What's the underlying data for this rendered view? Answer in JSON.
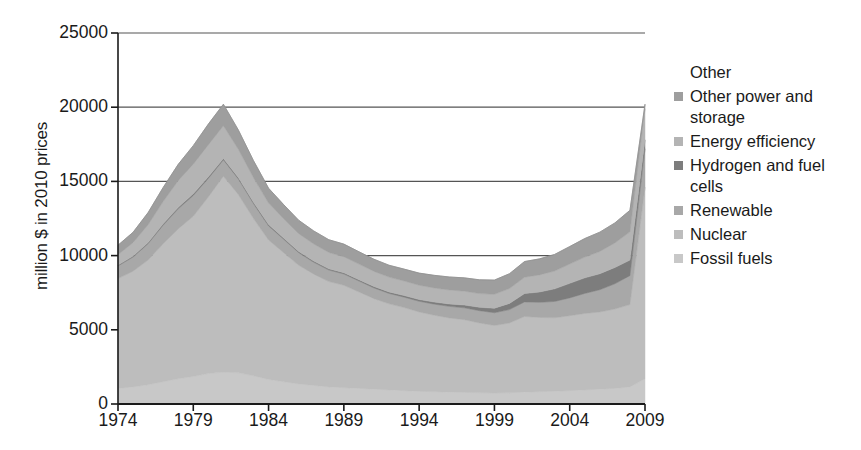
{
  "chart_data": {
    "type": "area",
    "stacked": true,
    "title": "",
    "xlabel": "",
    "ylabel": "million $ in 2010 prices",
    "xlim": [
      1974,
      2009
    ],
    "ylim": [
      0,
      25000
    ],
    "yticks": [
      0,
      5000,
      10000,
      15000,
      20000,
      25000
    ],
    "ytick_labels": [
      "0",
      "5000",
      "10000",
      "15000",
      "20000",
      "25000"
    ],
    "xticks": [
      1974,
      1979,
      1984,
      1989,
      1994,
      1999,
      2004,
      2009
    ],
    "xtick_labels": [
      "1974",
      "1979",
      "1984",
      "1989",
      "1994",
      "1999",
      "2004",
      "2009"
    ],
    "grid": "horizontal-partial",
    "legend_position": "right",
    "x": [
      1974,
      1975,
      1976,
      1977,
      1978,
      1979,
      1980,
      1981,
      1982,
      1983,
      1984,
      1985,
      1986,
      1987,
      1988,
      1989,
      1990,
      1991,
      1992,
      1993,
      1994,
      1995,
      1996,
      1997,
      1998,
      1999,
      2000,
      2001,
      2002,
      2003,
      2004,
      2005,
      2006,
      2007,
      2008,
      2009
    ],
    "series": [
      {
        "name": "Fossil fuels",
        "color": "#c8c8c8",
        "values": [
          1050,
          1150,
          1300,
          1500,
          1700,
          1850,
          2050,
          2150,
          2100,
          1900,
          1650,
          1500,
          1350,
          1250,
          1150,
          1100,
          1050,
          1000,
          950,
          900,
          850,
          830,
          800,
          780,
          760,
          740,
          760,
          800,
          830,
          860,
          900,
          950,
          1000,
          1050,
          1150,
          1700
        ]
      },
      {
        "name": "Nuclear",
        "color": "#bdbdbd",
        "values": [
          7400,
          7800,
          8400,
          9300,
          10100,
          10800,
          11900,
          13200,
          12000,
          10600,
          9400,
          8700,
          8000,
          7500,
          7100,
          6900,
          6500,
          6100,
          5800,
          5600,
          5350,
          5150,
          5000,
          4900,
          4700,
          4550,
          4700,
          5100,
          5000,
          4950,
          5050,
          5150,
          5200,
          5350,
          5550,
          12900
        ]
      },
      {
        "name": "Renewable",
        "color": "#a8a8a8",
        "values": [
          850,
          950,
          1100,
          1250,
          1350,
          1400,
          1250,
          1100,
          1050,
          1000,
          950,
          900,
          850,
          800,
          780,
          760,
          740,
          720,
          700,
          700,
          720,
          750,
          780,
          800,
          830,
          860,
          900,
          980,
          1020,
          1100,
          1200,
          1350,
          1500,
          1700,
          1950,
          2600
        ]
      },
      {
        "name": "Hydrogen and fuel cells",
        "color": "#7d7d7d",
        "values": [
          60,
          70,
          80,
          90,
          100,
          110,
          110,
          100,
          100,
          95,
          90,
          85,
          80,
          80,
          80,
          85,
          90,
          95,
          100,
          110,
          120,
          140,
          160,
          190,
          230,
          300,
          420,
          560,
          700,
          850,
          980,
          1050,
          1080,
          1100,
          1050,
          600
        ]
      },
      {
        "name": "Energy efficiency",
        "color": "#b4b4b4",
        "values": [
          700,
          900,
          1200,
          1500,
          1800,
          2000,
          2150,
          2200,
          1900,
          1650,
          1450,
          1300,
          1200,
          1150,
          1100,
          1080,
          1050,
          1020,
          1000,
          980,
          960,
          950,
          940,
          930,
          920,
          940,
          1000,
          1100,
          1150,
          1200,
          1300,
          1400,
          1500,
          1650,
          1900,
          2100
        ]
      },
      {
        "name": "Other power and storage",
        "color": "#9e9e9e",
        "values": [
          640,
          700,
          820,
          950,
          1100,
          1250,
          1400,
          1450,
          1300,
          1150,
          1000,
          950,
          900,
          880,
          860,
          850,
          830,
          820,
          800,
          800,
          820,
          850,
          880,
          900,
          930,
          960,
          1000,
          1060,
          1080,
          1120,
          1180,
          1250,
          1300,
          1350,
          1450,
          300
        ]
      }
    ],
    "totals": [
      10700,
      11570,
      12900,
      14590,
      16150,
      17410,
      18860,
      20200,
      18450,
      16395,
      14540,
      13435,
      12380,
      11660,
      11070,
      10775,
      10260,
      9755,
      9350,
      9090,
      8820,
      8670,
      8560,
      8500,
      8370,
      8350,
      8780,
      9600,
      9780,
      10080,
      10610,
      11150,
      11580,
      12200,
      13050,
      20200
    ],
    "annotations": []
  },
  "legend": {
    "header": "Other",
    "items": [
      {
        "label": "Other power and storage",
        "color": "#9e9e9e",
        "has_swatch": true
      },
      {
        "label": "Energy efficiency",
        "color": "#b4b4b4",
        "has_swatch": true
      },
      {
        "label": "Hydrogen and fuel cells",
        "color": "#7d7d7d",
        "has_swatch": true
      },
      {
        "label": "Renewable",
        "color": "#a8a8a8",
        "has_swatch": true
      },
      {
        "label": "Nuclear",
        "color": "#bdbdbd",
        "has_swatch": true
      },
      {
        "label": "Fossil fuels",
        "color": "#c8c8c8",
        "has_swatch": true
      }
    ]
  },
  "axis_colors": {
    "axis_line": "#1a1a1a",
    "grid_line": "#555555",
    "text": "#1a1a1a",
    "background": "#ffffff"
  }
}
